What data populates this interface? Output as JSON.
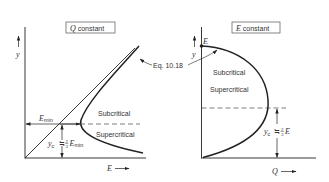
{
  "figure": {
    "left_panel": {
      "title_var": "Q",
      "title_text": " constant",
      "y_axis_label": "y",
      "x_axis_label": "E",
      "x_axis_arrow": "⟶",
      "emin_label": "E",
      "emin_sub": "min",
      "subcritical": "Subcritical",
      "supercritical": "Supercritical",
      "yc_label": "y",
      "yc_sub": "c",
      "approx": "≒",
      "frac_num": "2",
      "frac_den": "3",
      "yc_rhs_var": "E",
      "yc_rhs_sub": "min"
    },
    "right_panel": {
      "title_var": "E",
      "title_text": " constant",
      "y_axis_label": "y",
      "x_axis_label": "Q",
      "x_axis_arrow": "⟶",
      "point_label": "E",
      "subcritical": "Subcritical",
      "supercritical": "Supercritical",
      "yc_label": "y",
      "yc_sub": "c",
      "approx": "≒",
      "frac_num": "2",
      "frac_den": "3",
      "yc_rhs_var": "E"
    },
    "shared": {
      "equation_ref": "Eq. 10.18"
    },
    "colors": {
      "line": "#222222",
      "text": "#333333",
      "box_border": "#555555"
    }
  }
}
